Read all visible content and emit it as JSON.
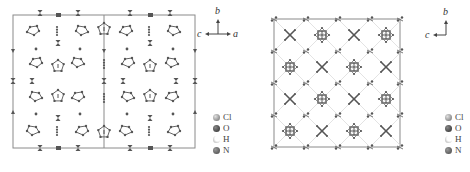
{
  "panels": [
    {
      "id": "left",
      "box": {
        "x": 13,
        "y": 15,
        "w": 182,
        "h": 133
      },
      "axes": {
        "up": "b",
        "left": "c",
        "right": "a"
      },
      "axis_origin": {
        "x": 218,
        "y": 33
      },
      "legend": [
        {
          "label": "Cl",
          "color": "#7a7a7a",
          "shade": "#c8c8c8"
        },
        {
          "label": "O",
          "color": "#3a3a3a",
          "shade": "#777777"
        },
        {
          "label": "H",
          "color": "#e6e6e6",
          "shade": "#9a9a9a"
        },
        {
          "label": "N",
          "color": "#555555",
          "shade": "#888888"
        }
      ]
    },
    {
      "id": "right",
      "box": {
        "x": 274,
        "y": 19,
        "w": 126,
        "h": 128
      },
      "axes": {
        "up": "b",
        "left": "c"
      },
      "axis_origin": {
        "x": 445,
        "y": 33
      },
      "legend": [
        {
          "label": "Cl",
          "color": "#7a7a7a",
          "shade": "#c8c8c8"
        },
        {
          "label": "O",
          "color": "#3a3a3a",
          "shade": "#777777"
        },
        {
          "label": "H",
          "color": "#e6e6e6",
          "shade": "#9a9a9a"
        },
        {
          "label": "N",
          "color": "#555555",
          "shade": "#888888"
        }
      ]
    }
  ],
  "colors": {
    "frame": "#8a8a8a",
    "atom": "#555555",
    "bond": "#666666"
  }
}
